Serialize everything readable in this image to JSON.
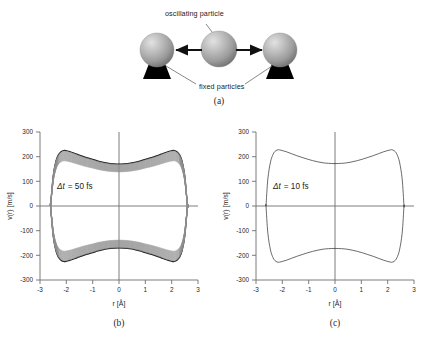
{
  "figure": {
    "panels": [
      {
        "key": "a",
        "caption": "(a)"
      },
      {
        "key": "b",
        "caption": "(b)"
      },
      {
        "key": "c",
        "caption": "(c)"
      }
    ]
  },
  "schematic": {
    "top_label": "oscillating particle",
    "bottom_label": "fixed particles",
    "particle_count": 3,
    "arrow_count": 2,
    "sphere_color": "#9a9a9a",
    "sphere_highlight": "#d8d8d8",
    "stand_color": "#000000"
  },
  "chart_data": [
    {
      "type": "line",
      "panel": "b",
      "title": "",
      "annotation": "Δt = 50 fs",
      "annotation_symbol": "Δt",
      "annotation_value": "= 50 fs",
      "xlabel": "r [Å]",
      "ylabel": "v(r) [m/s]",
      "xlim": [
        -3,
        3
      ],
      "ylim": [
        -300,
        300
      ],
      "xticks": [
        -3,
        -2,
        -1,
        0,
        1,
        2,
        3
      ],
      "yticks": [
        300,
        200,
        100,
        0,
        -100,
        -200,
        -300
      ],
      "grid": false,
      "legend": "none",
      "style": "dense-band of many overlapping phase-space orbits; dark at turning points",
      "band_count": 26,
      "band_half_width": 28,
      "r_turning_point": 2.6,
      "v_peak": 225,
      "v_at_center": 170,
      "r_of_peak": 2.1,
      "upper_branch": {
        "r": [
          -2.6,
          -2.5,
          -2.4,
          -2.3,
          -2.2,
          -2.1,
          -2.0,
          -1.8,
          -1.6,
          -1.4,
          -1.2,
          -1.0,
          -0.8,
          -0.6,
          -0.4,
          -0.2,
          0.0,
          0.2,
          0.4,
          0.6,
          0.8,
          1.0,
          1.2,
          1.4,
          1.6,
          1.8,
          2.0,
          2.1,
          2.2,
          2.3,
          2.4,
          2.5,
          2.6
        ],
        "v": [
          0,
          120,
          180,
          208,
          220,
          225,
          224,
          218,
          210,
          202,
          195,
          189,
          182,
          177,
          173,
          171,
          170,
          171,
          173,
          177,
          182,
          189,
          195,
          202,
          210,
          218,
          224,
          225,
          220,
          208,
          180,
          120,
          0
        ]
      },
      "lower_branch": {
        "r": [
          -2.6,
          -2.5,
          -2.4,
          -2.3,
          -2.2,
          -2.1,
          -2.0,
          -1.8,
          -1.6,
          -1.4,
          -1.2,
          -1.0,
          -0.8,
          -0.6,
          -0.4,
          -0.2,
          0.0,
          0.2,
          0.4,
          0.6,
          0.8,
          1.0,
          1.2,
          1.4,
          1.6,
          1.8,
          2.0,
          2.1,
          2.2,
          2.3,
          2.4,
          2.5,
          2.6
        ],
        "v": [
          0,
          -120,
          -180,
          -208,
          -220,
          -225,
          -224,
          -218,
          -210,
          -202,
          -195,
          -189,
          -182,
          -177,
          -173,
          -171,
          -170,
          -171,
          -173,
          -177,
          -182,
          -189,
          -195,
          -202,
          -210,
          -218,
          -224,
          -225,
          -220,
          -208,
          -180,
          -120,
          0
        ]
      }
    },
    {
      "type": "line",
      "panel": "c",
      "title": "",
      "annotation": "Δt = 10 fs",
      "annotation_symbol": "Δt",
      "annotation_value": "= 10 fs",
      "xlabel": "r [Å]",
      "ylabel": "v(r) [m/s]",
      "xlim": [
        -3,
        3
      ],
      "ylim": [
        -300,
        300
      ],
      "xticks": [
        -3,
        -2,
        -1,
        0,
        1,
        2,
        3
      ],
      "yticks": [
        300,
        200,
        100,
        0,
        -100,
        -200,
        -300
      ],
      "grid": false,
      "legend": "none",
      "style": "single thin closed phase-space orbit",
      "band_count": 1,
      "r_turning_point": 2.62,
      "v_peak": 228,
      "v_at_center": 172,
      "r_of_peak": 2.1,
      "upper_branch": {
        "r": [
          -2.62,
          -2.55,
          -2.45,
          -2.35,
          -2.25,
          -2.15,
          -2.05,
          -1.85,
          -1.65,
          -1.45,
          -1.25,
          -1.05,
          -0.85,
          -0.65,
          -0.45,
          -0.25,
          0.0,
          0.25,
          0.45,
          0.65,
          0.85,
          1.05,
          1.25,
          1.45,
          1.65,
          1.85,
          2.05,
          2.15,
          2.25,
          2.35,
          2.45,
          2.55,
          2.62
        ],
        "v": [
          0,
          110,
          178,
          210,
          224,
          228,
          226,
          220,
          212,
          204,
          197,
          190,
          184,
          179,
          175,
          173,
          172,
          173,
          175,
          179,
          184,
          190,
          197,
          204,
          212,
          220,
          226,
          228,
          224,
          210,
          178,
          110,
          0
        ]
      },
      "lower_branch": {
        "r": [
          -2.62,
          -2.55,
          -2.45,
          -2.35,
          -2.25,
          -2.15,
          -2.05,
          -1.85,
          -1.65,
          -1.45,
          -1.25,
          -1.05,
          -0.85,
          -0.65,
          -0.45,
          -0.25,
          0.0,
          0.25,
          0.45,
          0.65,
          0.85,
          1.05,
          1.25,
          1.45,
          1.65,
          1.85,
          2.05,
          2.15,
          2.25,
          2.35,
          2.45,
          2.55,
          2.62
        ],
        "v": [
          0,
          -110,
          -178,
          -210,
          -224,
          -228,
          -226,
          -220,
          -212,
          -204,
          -197,
          -190,
          -184,
          -179,
          -175,
          -173,
          -172,
          -173,
          -175,
          -179,
          -184,
          -190,
          -197,
          -204,
          -212,
          -220,
          -226,
          -228,
          -224,
          -210,
          -178,
          -110,
          0
        ]
      }
    }
  ]
}
